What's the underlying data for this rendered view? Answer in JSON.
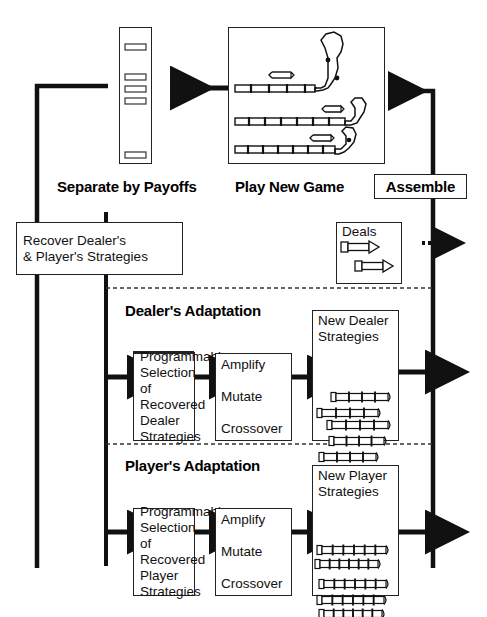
{
  "figure": {
    "type": "flow-diagram"
  },
  "top_row": {
    "separate": {
      "label": "Separate by Payoffs",
      "icon": "payoff-column-icon",
      "segments": [
        {
          "top": 16,
          "height": 6
        },
        {
          "top": 46,
          "height": 6
        },
        {
          "top": 58,
          "height": 6
        },
        {
          "top": 70,
          "height": 6
        },
        {
          "top": 124,
          "height": 6
        }
      ]
    },
    "play": {
      "label": "Play New Game",
      "icon": "game-tracks-icon",
      "tracks": [
        {
          "name": "track-1",
          "ticks": 5,
          "loop": "large"
        },
        {
          "name": "track-2",
          "ticks": 6,
          "loop": "medium"
        },
        {
          "name": "track-3",
          "ticks": 6,
          "loop": "small"
        }
      ]
    },
    "assemble": {
      "label": "Assemble"
    }
  },
  "recover": {
    "line1": "Recover Dealer's",
    "line2": "& Player's Strategies"
  },
  "deals": {
    "label": "Deals",
    "icon": "deal-arrow-icon",
    "count": 2
  },
  "dealer_section": {
    "title": "Dealer's Adaptation",
    "selection": {
      "lines": [
        "Programmable",
        "Selection of",
        "Recovered",
        "Dealer Strategies"
      ]
    },
    "operators": {
      "items": [
        "Amplify",
        "Mutate",
        "Crossover"
      ]
    },
    "output": {
      "line1": "New Dealer",
      "line2": "Strategies",
      "icon": "dealer-strategy-bars-icon",
      "bars": [
        {
          "left": 18,
          "top": 52,
          "width": 52,
          "ticks": 3
        },
        {
          "left": 4,
          "top": 68,
          "width": 56,
          "ticks": 3
        },
        {
          "left": 14,
          "top": 80,
          "width": 56,
          "ticks": 3
        },
        {
          "left": 16,
          "top": 96,
          "width": 50,
          "ticks": 3
        },
        {
          "left": 6,
          "top": 112,
          "width": 52,
          "ticks": 3
        }
      ]
    }
  },
  "player_section": {
    "title": "Player's Adaptation",
    "selection": {
      "lines": [
        "Programmable",
        "Selection of",
        "Recovered",
        "Player Strategies"
      ]
    },
    "operators": {
      "items": [
        "Amplify",
        "Mutate",
        "Crossover"
      ]
    },
    "output": {
      "line1": "New Player",
      "line2": "Strategies",
      "icon": "player-strategy-bars-icon",
      "bars": [
        {
          "left": 4,
          "top": 50,
          "width": 64,
          "ticks": 5
        },
        {
          "left": 2,
          "top": 64,
          "width": 58,
          "ticks": 5
        },
        {
          "left": 6,
          "top": 84,
          "width": 62,
          "ticks": 5
        },
        {
          "left": 4,
          "top": 100,
          "width": 62,
          "ticks": 5
        },
        {
          "left": 6,
          "top": 114,
          "width": 58,
          "ticks": 5
        }
      ]
    }
  },
  "colors": {
    "stroke": "#111111",
    "box_border": "#222222",
    "background": "#ffffff",
    "dash": "#333333"
  }
}
